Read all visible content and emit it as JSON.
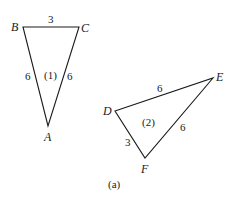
{
  "figure": {
    "caption": "(a)",
    "triangles": [
      {
        "id": "1",
        "label": "(1)",
        "vertices": {
          "B": "B",
          "C": "C",
          "A": "A"
        },
        "sides": {
          "BC": "3",
          "BA": "6",
          "CA": "6"
        }
      },
      {
        "id": "2",
        "label": "(2)",
        "vertices": {
          "D": "D",
          "E": "E",
          "F": "F"
        },
        "sides": {
          "DE": "6",
          "EF": "6",
          "DF": "3"
        }
      }
    ]
  }
}
